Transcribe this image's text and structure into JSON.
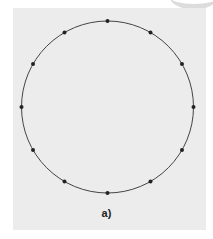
{
  "figure": {
    "label": "a)",
    "circle": {
      "cx": 107.5,
      "cy": 107,
      "r": 86,
      "stroke": "#444444"
    },
    "points_count": 12,
    "point_color": "#222222",
    "background": "#ececec"
  }
}
